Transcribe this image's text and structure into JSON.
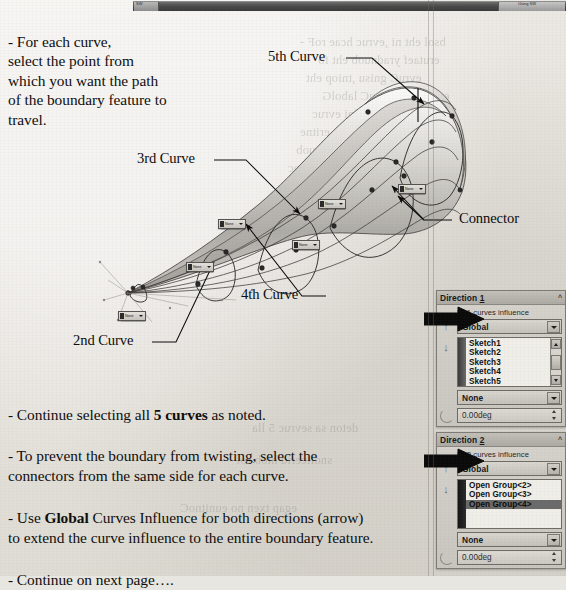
{
  "window": {
    "titlebar_left_label": "SW",
    "titlebar_right_label": "Using SW"
  },
  "instructions": {
    "intro": "- For each curve,\n  select the point  from\n  which you want the path\n  of the boundary feature to\n  travel.",
    "bullets": [
      {
        "before": "- Continue selecting all ",
        "bold": "5 curves",
        "after": " as noted."
      },
      {
        "before": "- To prevent the boundary from twisting, select the\n   connectors from the same side for each curve.",
        "bold": "",
        "after": ""
      },
      {
        "before": "- Use ",
        "bold": "Global",
        "after": " Curves Influence for both directions (arrow)\n   to extend the curve influence to the entire boundary feature."
      },
      {
        "before": "- Continue on next page….",
        "bold": "",
        "after": ""
      }
    ]
  },
  "callouts": [
    {
      "id": "curve-5",
      "label": "5th Curve"
    },
    {
      "id": "curve-3",
      "label": "3rd Curve"
    },
    {
      "id": "curve-4",
      "label": "4th Curve"
    },
    {
      "id": "curve-2",
      "label": "2nd Curve"
    },
    {
      "id": "connector",
      "label": "Connector"
    }
  ],
  "model_callout_dropdowns": [
    {
      "value": "None"
    },
    {
      "value": "None"
    },
    {
      "value": "None"
    },
    {
      "value": "None"
    },
    {
      "value": "None"
    },
    {
      "value": "None"
    }
  ],
  "property_manager": {
    "direction1": {
      "title": "Direction ",
      "title_num": "1",
      "collapse_caret": "^",
      "influence_label": "Dir1 curves influence",
      "influence_value": "Global",
      "list_items": [
        "Sketch1",
        "Sketch2",
        "Sketch3",
        "Sketch4",
        "Sketch5"
      ],
      "selected_index": -1,
      "tangency_value": "None",
      "angle_value": "0.00deg",
      "up_arrow": "↑",
      "down_arrow": "↓"
    },
    "direction2": {
      "title": "Direction ",
      "title_num": "2",
      "collapse_caret": "^",
      "influence_label": "Dir2 curves influence",
      "influence_value": "Global",
      "list_items": [
        "Open Group<2>",
        "Open Group<3>",
        "Open Group<4>"
      ],
      "selected_index": 2,
      "tangency_value": "None",
      "angle_value": "0.00deg",
      "up_arrow": "↑",
      "down_arrow": "↓"
    }
  },
  "ghost_text": [
    {
      "t": "bsol eht ni ,evruc hcae roF -",
      "x": 300,
      "y": 34
    },
    {
      "t": "erutaef yradnuob eht fo",
      "x": 318,
      "y": 52
    },
    {
      "t": "evruC gnisu ,tniop eht",
      "x": 306,
      "y": 70
    },
    {
      "t": "ecneulfnI sevruC labolG",
      "x": 322,
      "y": 88
    },
    {
      "t": "eht ot ecneulfni evruc",
      "x": 312,
      "y": 106
    },
    {
      "t": "erutaef yradnuob eritne",
      "x": 300,
      "y": 124
    },
    {
      "t": "gnitsiwt morf yradnuob",
      "x": 296,
      "y": 142
    },
    {
      "t": "edis emas eht morf srotcennoc",
      "x": 288,
      "y": 160
    },
    {
      "t": "evruc hcae rof",
      "x": 330,
      "y": 178
    },
    {
      "t": "deton sa sevruc 5 lla",
      "x": 252,
      "y": 420
    },
    {
      "t": "snoitcerid htob rof",
      "x": 236,
      "y": 452
    },
    {
      "t": "egap txen no eunitnoC",
      "x": 180,
      "y": 500
    }
  ]
}
